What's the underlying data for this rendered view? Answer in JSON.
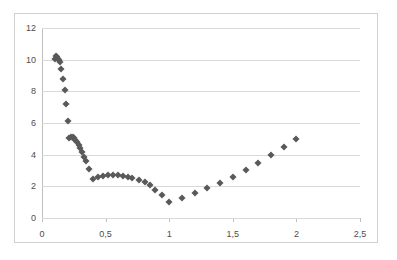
{
  "title_strip": "",
  "axes": {
    "y_ticks": [
      "0",
      "2",
      "4",
      "6",
      "8",
      "10",
      "12"
    ],
    "x_ticks": [
      "0",
      "0,5",
      "1",
      "1,5",
      "2",
      "2,5"
    ],
    "marker_color": "#595959",
    "gridline_color": "#d9d9d9",
    "axis_color": "#bfbfbf",
    "background": "#ffffff",
    "border_color": "#d0d0d0"
  },
  "chart_data": {
    "type": "scatter",
    "title": "",
    "xlabel": "",
    "ylabel": "",
    "xlim": [
      0,
      2.5
    ],
    "ylim": [
      0,
      12
    ],
    "xticks": [
      0,
      0.5,
      1,
      1.5,
      2,
      2.5
    ],
    "yticks": [
      0,
      2,
      4,
      6,
      8,
      10,
      12
    ],
    "xtick_labels": [
      "0",
      "0,5",
      "1",
      "1,5",
      "2",
      "2,5"
    ],
    "ytick_labels": [
      "0",
      "2",
      "4",
      "6",
      "8",
      "10",
      "12"
    ],
    "decimal_separator": ",",
    "grid": "horizontal",
    "legend": "none",
    "marker": "diamond",
    "marker_color": "#595959",
    "series": [
      {
        "name": "series-1",
        "points": [
          [
            0.105,
            10.05
          ],
          [
            0.112,
            10.25
          ],
          [
            0.118,
            10.15
          ],
          [
            0.125,
            10.05
          ],
          [
            0.132,
            9.95
          ],
          [
            0.14,
            9.85
          ],
          [
            0.15,
            9.4
          ],
          [
            0.165,
            8.8
          ],
          [
            0.178,
            8.1
          ],
          [
            0.19,
            7.2
          ],
          [
            0.205,
            6.15
          ],
          [
            0.215,
            5.05
          ],
          [
            0.228,
            5.1
          ],
          [
            0.24,
            5.12
          ],
          [
            0.252,
            5.05
          ],
          [
            0.263,
            4.95
          ],
          [
            0.275,
            4.8
          ],
          [
            0.288,
            4.6
          ],
          [
            0.3,
            4.4
          ],
          [
            0.315,
            4.15
          ],
          [
            0.33,
            3.85
          ],
          [
            0.348,
            3.6
          ],
          [
            0.368,
            3.1
          ],
          [
            0.4,
            2.48
          ],
          [
            0.44,
            2.6
          ],
          [
            0.48,
            2.68
          ],
          [
            0.52,
            2.72
          ],
          [
            0.56,
            2.72
          ],
          [
            0.6,
            2.72
          ],
          [
            0.64,
            2.68
          ],
          [
            0.68,
            2.62
          ],
          [
            0.71,
            2.52
          ],
          [
            0.76,
            2.4
          ],
          [
            0.81,
            2.3
          ],
          [
            0.85,
            2.1
          ],
          [
            0.89,
            1.8
          ],
          [
            0.945,
            1.45
          ],
          [
            1.0,
            1.0
          ],
          [
            1.1,
            1.28
          ],
          [
            1.2,
            1.58
          ],
          [
            1.3,
            1.9
          ],
          [
            1.4,
            2.22
          ],
          [
            1.5,
            2.62
          ],
          [
            1.6,
            3.05
          ],
          [
            1.7,
            3.5
          ],
          [
            1.8,
            3.95
          ],
          [
            1.9,
            4.48
          ],
          [
            2.0,
            5.0
          ]
        ]
      }
    ]
  }
}
